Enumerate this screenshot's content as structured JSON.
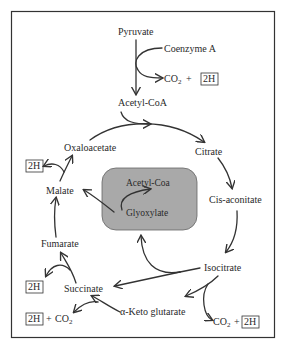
{
  "diagram": {
    "colors": {
      "frame": "#333333",
      "center_box_fill": "#a9a9a9",
      "text": "#2a2a2a",
      "background": "#ffffff"
    },
    "nodes": {
      "pyruvate": "Pyruvate",
      "coenzyme_a": "Coenzyme A",
      "co2_top": "CO",
      "co2_top_sub": "2",
      "plus_top": "+",
      "h2_top": "2H",
      "acetyl_coa": "Acetyl-CoA",
      "citrate": "Citrate",
      "cis_aconitate": "Cis-aconitate",
      "isocitrate": "Isocitrate",
      "co2_right": "CO",
      "co2_right_sub": "2",
      "plus_right": "+",
      "h2_right": "2H",
      "alpha_keto_glutarate": "α-Keto glutarate",
      "succinate": "Succinate",
      "h2_succ": "2H",
      "h2_alpha": "2H",
      "plus_alpha": "+",
      "co2_alpha": "CO",
      "co2_alpha_sub": "2",
      "fumarate": "Fumarate",
      "malate": "Malate",
      "h2_malate": "2H",
      "oxaloacetate": "Oxaloacetate",
      "center_acetyl_coa": "Acetyl-Coa",
      "center_glyoxylate": "Glyoxylate"
    },
    "edges": [
      {
        "from": "Pyruvate",
        "to": "Acetyl-CoA"
      },
      {
        "from": "Coenzyme A",
        "to": "CO2 + 2H"
      },
      {
        "from": "Acetyl-CoA",
        "to": "Citrate"
      },
      {
        "from": "Oxaloacetate",
        "to": "Citrate"
      },
      {
        "from": "Citrate",
        "to": "Cis-aconitate"
      },
      {
        "from": "Cis-aconitate",
        "to": "Isocitrate"
      },
      {
        "from": "Isocitrate",
        "to": "α-Keto glutarate"
      },
      {
        "from": "Isocitrate",
        "to": "CO2 + 2H"
      },
      {
        "from": "Isocitrate",
        "to": "Glyoxylate"
      },
      {
        "from": "Isocitrate",
        "to": "Succinate"
      },
      {
        "from": "α-Keto glutarate",
        "to": "Succinate"
      },
      {
        "from": "α-Keto glutarate",
        "to": "2H + CO2"
      },
      {
        "from": "Succinate",
        "to": "Fumarate"
      },
      {
        "from": "Succinate",
        "to": "2H"
      },
      {
        "from": "Fumarate",
        "to": "Malate"
      },
      {
        "from": "Glyoxylate",
        "to": "Malate"
      },
      {
        "from": "Glyoxylate",
        "to": "Acetyl-Coa"
      },
      {
        "from": "Malate",
        "to": "Oxaloacetate"
      },
      {
        "from": "Malate",
        "to": "2H"
      }
    ]
  }
}
